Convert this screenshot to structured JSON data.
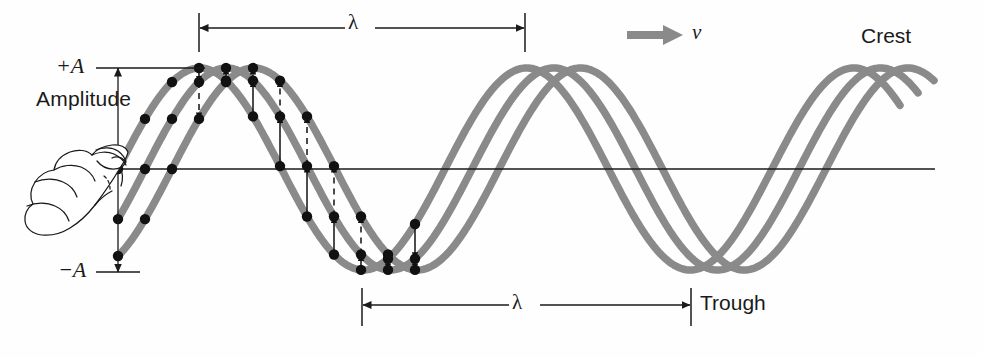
{
  "figure": {
    "background_color": "#fefefe",
    "wave_color": "#8a8a8a",
    "ink_color": "#1a1a1a"
  },
  "labels": {
    "amplitude": "Amplitude",
    "plus_a": "+A",
    "minus_a": "−A",
    "lambda_top": "λ",
    "lambda_bottom": "λ",
    "velocity": "v",
    "crest": "Crest",
    "trough": "Trough"
  },
  "annotations": {
    "velocity_arrow": "gray-right-arrow",
    "amplitude_arrow": "double-headed-vertical-arrow",
    "lambda_top_arrow": "double-headed-horizontal-arrow",
    "lambda_bottom_arrow": "double-headed-horizontal-arrow",
    "hand": "hand-holding-string-icon"
  },
  "chart_data": {
    "type": "line",
    "xlabel": "",
    "ylabel": "",
    "xlim": [
      118,
      935
    ],
    "ylim": [
      -1.08,
      1.08
    ],
    "grid": false,
    "legend": "none",
    "axis_line_y": 169,
    "amplitude_px": 101,
    "wavelength_px": 327,
    "series": [
      {
        "name": "snapshot-1",
        "phase_offset_px": 0,
        "x_start": 118,
        "x_end": 900,
        "color": "#8a8a8a"
      },
      {
        "name": "snapshot-2",
        "phase_offset_px": 27,
        "x_start": 118,
        "x_end": 918,
        "color": "#8a8a8a"
      },
      {
        "name": "snapshot-3",
        "phase_offset_px": 54,
        "x_start": 118,
        "x_end": 935,
        "color": "#8a8a8a"
      }
    ],
    "markers": {
      "description": "black dots marking particle positions on each snapshot curve",
      "x_range": [
        118,
        420
      ],
      "spacing_px": 27
    },
    "displacement_arrows": {
      "description": "vertical solid and dashed arrows showing particle displacement between successive snapshots",
      "x_range": [
        190,
        420
      ]
    },
    "dimensions": [
      {
        "name": "lambda_top",
        "label": "λ",
        "x1": 199,
        "x2": 525,
        "y": 28,
        "value_px": 326
      },
      {
        "name": "lambda_bottom",
        "label": "λ",
        "x1": 362,
        "x2": 691,
        "y": 305,
        "value_px": 329
      },
      {
        "name": "amplitude",
        "label": "Amplitude",
        "x": 118,
        "y1": 68,
        "y2": 272,
        "value_px": 204
      }
    ],
    "tick_labels": [
      {
        "label": "+A",
        "y": 68
      },
      {
        "label": "−A",
        "y": 272
      }
    ]
  }
}
